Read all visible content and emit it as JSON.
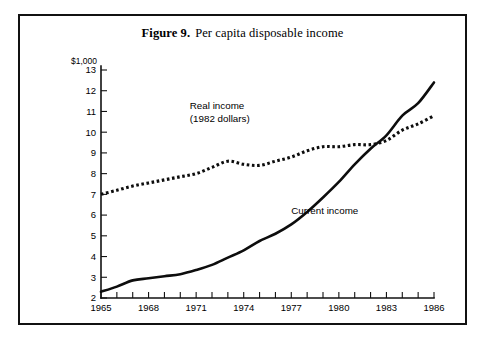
{
  "figure": {
    "number": "Figure 9.",
    "caption": "Per capita disposable income"
  },
  "chart_data": {
    "type": "line",
    "xlabel": "",
    "ylabel": "$1,000",
    "y_unit_label": "$1,000",
    "xlim": [
      1965,
      1986
    ],
    "ylim": [
      2,
      13
    ],
    "grid": false,
    "legend": "inline-annotations",
    "y_ticks": [
      2,
      3,
      4,
      5,
      6,
      7,
      8,
      9,
      10,
      11,
      12,
      13
    ],
    "y_tick_labels": [
      "2",
      "3",
      "4",
      "5",
      "6",
      "7",
      "8",
      "9",
      "10",
      "11",
      "12",
      "13"
    ],
    "x_ticks": [
      1965,
      1966,
      1967,
      1968,
      1969,
      1970,
      1971,
      1972,
      1973,
      1974,
      1975,
      1976,
      1977,
      1978,
      1979,
      1980,
      1981,
      1982,
      1983,
      1984,
      1985,
      1986
    ],
    "x_tick_labels_shown": [
      "1965",
      "1968",
      "1971",
      "1974",
      "1977",
      "1980",
      "1983",
      "1986"
    ],
    "x": [
      1965,
      1966,
      1967,
      1968,
      1969,
      1970,
      1971,
      1972,
      1973,
      1974,
      1975,
      1976,
      1977,
      1978,
      1979,
      1980,
      1981,
      1982,
      1983,
      1984,
      1985,
      1986
    ],
    "series": [
      {
        "name": "Current income",
        "style": "solid",
        "label_text": "Current income",
        "values": [
          2.3,
          2.55,
          2.85,
          2.95,
          3.05,
          3.15,
          3.35,
          3.6,
          3.95,
          4.3,
          4.75,
          5.1,
          5.55,
          6.15,
          6.85,
          7.6,
          8.45,
          9.2,
          9.85,
          10.8,
          11.4,
          12.4
        ]
      },
      {
        "name": "Real income (1982 dollars)",
        "style": "dotted",
        "label_line1": "Real income",
        "label_line2": "(1982 dollars)",
        "values": [
          7.0,
          7.2,
          7.4,
          7.55,
          7.7,
          7.85,
          8.0,
          8.3,
          8.6,
          8.45,
          8.4,
          8.6,
          8.8,
          9.1,
          9.3,
          9.3,
          9.4,
          9.4,
          9.6,
          10.1,
          10.4,
          10.8
        ]
      }
    ],
    "annotations": [
      {
        "text": "Real income",
        "x": 1970.6,
        "y": 11.1
      },
      {
        "text": "(1982 dollars)",
        "x": 1970.6,
        "y": 10.5
      },
      {
        "text": "Current income",
        "x": 1977.0,
        "y": 6.05
      }
    ],
    "colors": {
      "line": "#0d0d0d",
      "axis": "#111111",
      "background": "#ffffff",
      "frame": "#111111"
    }
  }
}
